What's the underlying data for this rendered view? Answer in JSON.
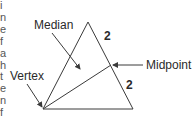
{
  "diagram": {
    "type": "triangle-median",
    "labels": {
      "median": "Median",
      "vertex": "Vertex",
      "midpoint": "Midpoint",
      "segment_top": "2",
      "segment_bottom": "2"
    },
    "edge_fragments": [
      "i",
      "n",
      "e",
      "f",
      "a",
      "h",
      "t",
      "e",
      "n",
      "f",
      "."
    ],
    "colors": {
      "stroke": "#3a3a3a",
      "text": "#2a2a2a",
      "background": "#ffffff"
    },
    "points": {
      "apex": [
        88,
        22
      ],
      "vertex": [
        43,
        109
      ],
      "bottom_right": [
        133,
        109
      ],
      "midpoint": [
        111,
        65
      ]
    }
  }
}
